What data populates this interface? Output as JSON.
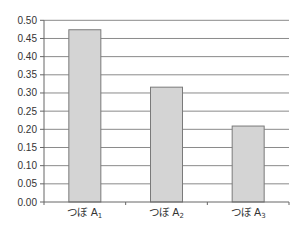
{
  "chart_data": {
    "type": "bar",
    "title": "",
    "xlabel": "",
    "ylabel": "",
    "categories": [
      "つぼ A₁",
      "つぼ A₂",
      "つぼ A₃"
    ],
    "category_parts": [
      {
        "main": "つぼ A",
        "sub": "1"
      },
      {
        "main": "つぼ A",
        "sub": "2"
      },
      {
        "main": "つぼ A",
        "sub": "3"
      }
    ],
    "values": [
      0.474,
      0.316,
      0.209
    ],
    "ylim": [
      0,
      0.5
    ],
    "yticks": [
      "0.00",
      "0.05",
      "0.10",
      "0.15",
      "0.20",
      "0.25",
      "0.30",
      "0.35",
      "0.40",
      "0.45",
      "0.50"
    ],
    "grid": true,
    "legend": null,
    "colors": {
      "bar_fill": "#d4d4d4",
      "bar_stroke": "#7a7a7a",
      "grid": "#8a8a8a",
      "axis": "#666666",
      "text": "#333333"
    }
  }
}
